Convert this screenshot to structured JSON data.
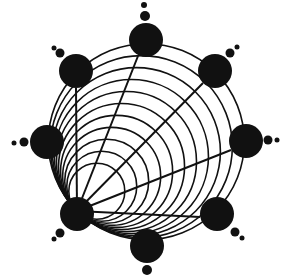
{
  "diagram": {
    "background": "#ffffff",
    "ink": "#111111",
    "outer_circle": {
      "cx": 146,
      "cy": 142,
      "r": 98
    },
    "tangent_point": {
      "x": 77,
      "y": 211
    },
    "nested_circle_radii": [
      28,
      35,
      42,
      49,
      56,
      63,
      70,
      77,
      84,
      91,
      98
    ],
    "nodes": [
      {
        "id": "top",
        "cx": 146,
        "cy": 40,
        "r": 17,
        "satellites": [
          {
            "cx": 145,
            "cy": 16,
            "r": 5
          },
          {
            "cx": 144,
            "cy": 5,
            "r": 3
          }
        ]
      },
      {
        "id": "upper-right",
        "cx": 215,
        "cy": 71,
        "r": 17,
        "satellites": [
          {
            "cx": 230,
            "cy": 53,
            "r": 4.5
          },
          {
            "cx": 237,
            "cy": 47,
            "r": 2.5
          }
        ]
      },
      {
        "id": "right",
        "cx": 246,
        "cy": 141,
        "r": 17,
        "satellites": [
          {
            "cx": 268,
            "cy": 140,
            "r": 4.5
          },
          {
            "cx": 277,
            "cy": 140,
            "r": 2.5
          }
        ]
      },
      {
        "id": "lower-right",
        "cx": 217,
        "cy": 214,
        "r": 17,
        "satellites": [
          {
            "cx": 235,
            "cy": 232,
            "r": 4.5
          },
          {
            "cx": 242,
            "cy": 238,
            "r": 2.5
          }
        ]
      },
      {
        "id": "bottom",
        "cx": 147,
        "cy": 246,
        "r": 17,
        "satellites": [
          {
            "cx": 147,
            "cy": 270,
            "r": 5
          }
        ]
      },
      {
        "id": "lower-left",
        "cx": 77,
        "cy": 214,
        "r": 17,
        "satellites": [
          {
            "cx": 60,
            "cy": 233,
            "r": 4.5
          },
          {
            "cx": 54,
            "cy": 239,
            "r": 2.5
          }
        ]
      },
      {
        "id": "left",
        "cx": 47,
        "cy": 142,
        "r": 17,
        "satellites": [
          {
            "cx": 24,
            "cy": 142,
            "r": 4.5
          },
          {
            "cx": 14,
            "cy": 143,
            "r": 2.5
          }
        ]
      },
      {
        "id": "upper-left",
        "cx": 76,
        "cy": 71,
        "r": 17,
        "satellites": [
          {
            "cx": 60,
            "cy": 53,
            "r": 4.5
          },
          {
            "cx": 54,
            "cy": 48,
            "r": 2.5
          }
        ]
      }
    ],
    "spokes": [
      {
        "to": "upper-left",
        "x2": 76,
        "y2": 88
      },
      {
        "to": "top",
        "x2": 138,
        "y2": 56
      },
      {
        "to": "upper-right",
        "x2": 203,
        "y2": 83
      },
      {
        "to": "right",
        "x2": 231,
        "y2": 150
      },
      {
        "to": "lower-right",
        "x2": 200,
        "y2": 217
      }
    ]
  }
}
